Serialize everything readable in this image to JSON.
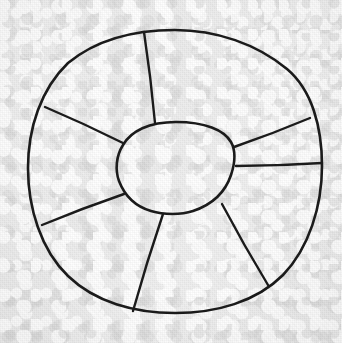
{
  "document": {
    "title": "Hand-drawn sectioned annulus diagram",
    "medium": "pencil/ink on textured paper",
    "visible_text": "",
    "labels": []
  },
  "canvas": {
    "width": 342,
    "height": 343,
    "background_color": "#eeeeee",
    "paper_tone_light": "#f4f4f4",
    "paper_tone_dark": "#e4e4e4"
  },
  "ink": {
    "color": "#1b1b1b",
    "outer_circle_stroke_width": 2.6,
    "inner_circle_stroke_width": 2.6,
    "spoke_stroke_width": 2.4
  },
  "figure": {
    "type": "annulus-sector-diagram",
    "sector_count": 6,
    "outer_circle": {
      "name": "outer-circle",
      "cx": 175,
      "cy": 171.5,
      "rx": 147,
      "ry": 141.5,
      "left_x": 28,
      "right_x": 322,
      "top_y": 30,
      "bottom_y": 313
    },
    "inner_circle": {
      "name": "inner-circle",
      "cx": 176,
      "cy": 168,
      "rx": 59,
      "ry": 46,
      "left_x": 117,
      "right_x": 235,
      "top_y": 122,
      "bottom_y": 214
    },
    "spokes": [
      {
        "name": "spoke-top",
        "inner_x": 155,
        "inner_y": 123,
        "outer_x": 144,
        "outer_y": 32,
        "angle_deg": 263
      },
      {
        "name": "spoke-upper-left",
        "inner_x": 123,
        "inner_y": 143,
        "outer_x": 45,
        "outer_y": 107,
        "angle_deg": 205
      },
      {
        "name": "spoke-lower-left",
        "inner_x": 124,
        "inner_y": 194,
        "outer_x": 42,
        "outer_y": 225,
        "angle_deg": 159
      },
      {
        "name": "spoke-bottom",
        "inner_x": 163,
        "inner_y": 214,
        "outer_x": 133,
        "outer_y": 311,
        "angle_deg": 107
      },
      {
        "name": "spoke-lower-right",
        "inner_x": 222,
        "inner_y": 204,
        "outer_x": 268,
        "outer_y": 285,
        "angle_deg": 60
      },
      {
        "name": "spoke-right",
        "inner_x": 236,
        "inner_y": 166,
        "outer_x": 322,
        "outer_y": 163,
        "angle_deg": 2
      },
      {
        "name": "spoke-upper-right",
        "inner_x": 234,
        "inner_y": 147,
        "outer_x": 310,
        "outer_y": 118,
        "angle_deg": 339
      }
    ],
    "sectors": [
      {
        "name": "sector-north",
        "between": [
          "spoke-upper-right",
          "spoke-top"
        ]
      },
      {
        "name": "sector-northwest",
        "between": [
          "spoke-top",
          "spoke-upper-left"
        ]
      },
      {
        "name": "sector-west",
        "between": [
          "spoke-upper-left",
          "spoke-lower-left"
        ]
      },
      {
        "name": "sector-southwest",
        "between": [
          "spoke-lower-left",
          "spoke-bottom"
        ]
      },
      {
        "name": "sector-south",
        "between": [
          "spoke-bottom",
          "spoke-lower-right"
        ]
      },
      {
        "name": "sector-southeast",
        "between": [
          "spoke-lower-right",
          "spoke-right"
        ]
      },
      {
        "name": "sector-east",
        "between": [
          "spoke-right",
          "spoke-upper-right"
        ]
      }
    ]
  }
}
